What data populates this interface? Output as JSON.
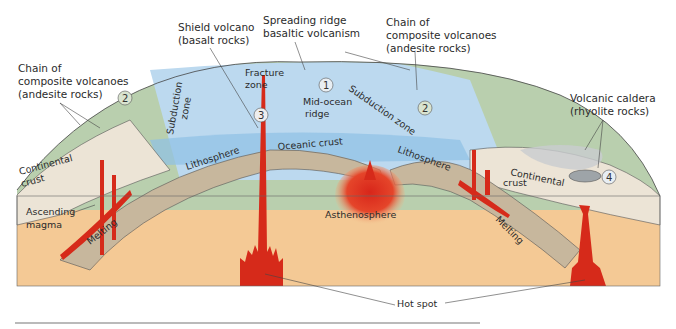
{
  "diagram": {
    "title_labels": {
      "shield_volcano": [
        "Shield volcano",
        "(basalt rocks)"
      ],
      "spreading_ridge": [
        "Spreading ridge",
        "basaltic volcanism"
      ],
      "chain_right": [
        "Chain of",
        "composite volcanoes",
        "(andesite rocks)"
      ],
      "chain_left": [
        "Chain of",
        "composite volcanoes",
        "(andesite rocks)"
      ],
      "caldera": [
        "Volcanic caldera",
        "(rhyolite rocks)"
      ]
    },
    "surface_labels": {
      "fracture_zone": [
        "Fracture",
        "zone"
      ],
      "mid_ocean_ridge": [
        "Mid-ocean",
        "ridge"
      ],
      "subduction_zone_left": [
        "Subduction",
        "zone"
      ],
      "subduction_zone_right": "Subduction zone",
      "oceanic_crust": "Oceanic crust"
    },
    "section_labels": {
      "continental_crust_left": [
        "Continental",
        "crust"
      ],
      "continental_crust_right": [
        "Continental",
        "crust"
      ],
      "lithosphere_left": "Lithosphere",
      "lithosphere_right": "Lithosphere",
      "ascending_magma": [
        "Ascending",
        "magma"
      ],
      "melting_left": "Melting",
      "melting_right": "Melting",
      "asthenosphere": "Asthenosphere",
      "hot_spot": "Hot spot"
    },
    "markers": [
      "1",
      "2",
      "2",
      "3",
      "4"
    ],
    "colors": {
      "ocean": "#bcd9ef",
      "ocean_deep": "#8fc0e6",
      "land": "#b9cfae",
      "lithosphere": "#c7b79d",
      "mantle": "#f4c995",
      "continental_crust": "#ece4d6",
      "magma": "#d62a1a",
      "caldera": "#c9cccf"
    }
  }
}
